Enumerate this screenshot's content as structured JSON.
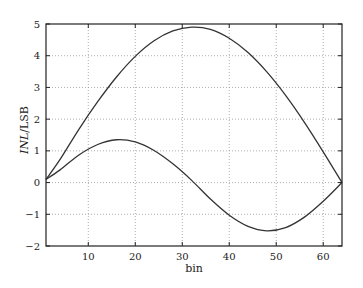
{
  "chart_data": {
    "type": "line",
    "title": "",
    "xlabel": "bin",
    "ylabel_italic": "INL",
    "ylabel_rest": "/LSB",
    "ylabel": "INL/LSB",
    "xlim": [
      1,
      64
    ],
    "ylim": [
      -2,
      5
    ],
    "grid": true,
    "legend": null,
    "x_ticks": [
      10,
      20,
      30,
      40,
      50,
      60
    ],
    "y_ticks": [
      -2,
      -1,
      0,
      1,
      2,
      3,
      4,
      5
    ],
    "x": [
      1,
      4,
      8,
      12,
      16,
      20,
      24,
      28,
      32,
      36,
      40,
      44,
      48,
      52,
      56,
      60,
      64
    ],
    "series": [
      {
        "name": "curve-1 (half-sine)",
        "color": "#333333",
        "values": [
          0.1,
          0.73,
          1.68,
          2.55,
          3.33,
          3.98,
          4.47,
          4.78,
          4.9,
          4.83,
          4.55,
          4.1,
          3.49,
          2.75,
          1.9,
          0.97,
          0.0
        ]
      },
      {
        "name": "curve-2 (full-sine)",
        "color": "#333333",
        "values": [
          0.1,
          0.4,
          0.87,
          1.2,
          1.35,
          1.28,
          1.01,
          0.59,
          0.07,
          -0.52,
          -1.03,
          -1.38,
          -1.52,
          -1.42,
          -1.09,
          -0.59,
          0.0
        ]
      }
    ]
  },
  "plot_area": {
    "left": 46,
    "top": 24,
    "right": 342,
    "bottom": 246
  }
}
